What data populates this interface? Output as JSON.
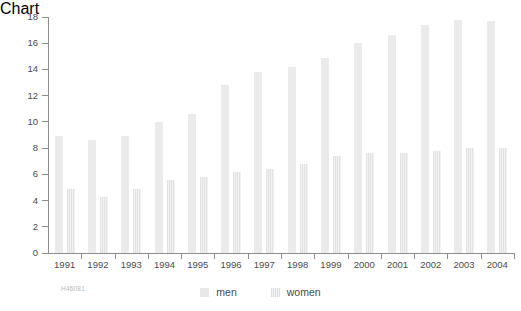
{
  "watermark": "H46081",
  "legend": {
    "position": "bottom-center",
    "entries": [
      {
        "label": "men",
        "swatch": "solid-light-gray"
      },
      {
        "label": "women",
        "swatch": "striped-light-gray"
      }
    ]
  },
  "axis": {
    "y_ticks": [
      "0",
      "2",
      "4",
      "6",
      "8",
      "10",
      "12",
      "14",
      "16",
      "18"
    ],
    "x_ticks": [
      "1991",
      "1992",
      "1993",
      "1994",
      "1995",
      "1996",
      "1997",
      "1998",
      "1999",
      "2000",
      "2001",
      "2002",
      "2003",
      "2004"
    ]
  },
  "colors": {
    "bar_men": "#ebebeb",
    "bar_women": "#e8e8e8",
    "axis": "#8d8d8d",
    "text": "#4b4b4b",
    "background": "#ffffff",
    "watermark": "#b9b9b9"
  },
  "chart_data": {
    "type": "bar",
    "title": "",
    "subtitle": "",
    "xlabel": "",
    "ylabel": "",
    "ylim": [
      0,
      18
    ],
    "ytick_step": 2,
    "grid": false,
    "legend_position": "bottom",
    "categories": [
      "1991",
      "1992",
      "1993",
      "1994",
      "1995",
      "1996",
      "1997",
      "1998",
      "1999",
      "2000",
      "2001",
      "2002",
      "2003",
      "2004"
    ],
    "series": [
      {
        "name": "men",
        "values": [
          8.9,
          8.6,
          8.9,
          10.0,
          10.6,
          12.8,
          13.8,
          14.2,
          14.9,
          16.0,
          16.6,
          17.4,
          17.8,
          17.7
        ]
      },
      {
        "name": "women",
        "values": [
          4.9,
          4.3,
          4.9,
          5.6,
          5.8,
          6.2,
          6.4,
          6.8,
          7.4,
          7.6,
          7.6,
          7.8,
          8.0,
          8.0
        ]
      }
    ]
  }
}
